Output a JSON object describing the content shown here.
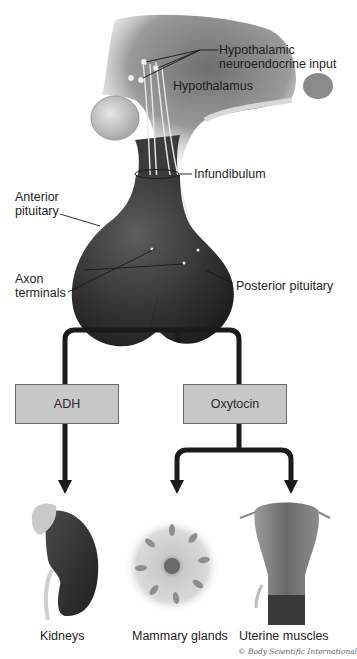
{
  "diagram": {
    "labels": {
      "hypothalamic_input_line1": "Hypothalamic",
      "hypothalamic_input_line2": "neuroendocrine input",
      "hypothalamus": "Hypothalamus",
      "infundibulum": "Infundibulum",
      "anterior_line1": "Anterior",
      "anterior_line2": "pituitary",
      "axon_line1": "Axon",
      "axon_line2": "terminals",
      "posterior": "Posterior pituitary"
    },
    "hormones": [
      {
        "id": "adh",
        "label": "ADH",
        "targets": [
          "Kidneys"
        ]
      },
      {
        "id": "oxytocin",
        "label": "Oxytocin",
        "targets": [
          "Mammary glands",
          "Uterine muscles"
        ]
      }
    ],
    "targets": [
      {
        "id": "kidneys",
        "label": "Kidneys"
      },
      {
        "id": "mammary",
        "label": "Mammary glands"
      },
      {
        "id": "uterine",
        "label": "Uterine muscles"
      }
    ],
    "copyright": "© Body Scientific International",
    "colors": {
      "box_fill": "#c8c8c8",
      "box_border": "#6a6a6a",
      "connector": "#1a1a1a",
      "gland_dark": "#2e2e2e"
    }
  }
}
